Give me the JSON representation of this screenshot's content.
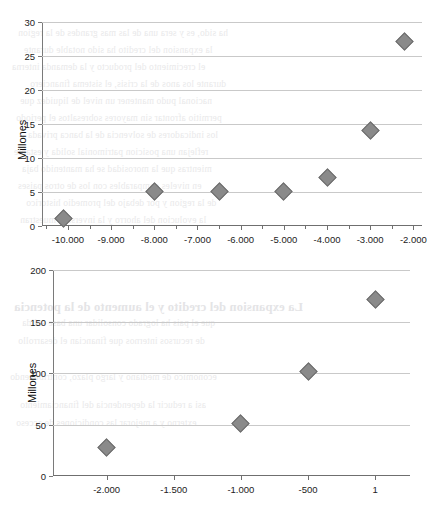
{
  "page": {
    "background_color": "#ffffff",
    "marker_color": "#8a8a8a",
    "marker_border_color": "#6d6d6d",
    "gridline_color": "#c9c9c9",
    "axis_color": "#6f6f6f"
  },
  "bleed_text": [
    "ha sido, es y sera una de las mas grandes de la region",
    "la expansion del credito ha sido notable durante",
    "el crecimiento del producto y la demanda interna",
    "durante los anos de la crisis, el sistema financiero",
    "nacional pudo mantener un nivel de liquidez que",
    "permitio afrontar sin mayores sobresaltos el periodo",
    "los indicadores de solvencia de la banca privada",
    "reflejan una posicion patrimonial solida y estable",
    "mientras que la morosidad se ha mantenido baja",
    "en niveles comparables con los de otros paises",
    "de la region y por debajo del promedio historico",
    "la evolucion del ahorro y la inversion muestran",
    "La expansion del credito y el aumento de la potencia",
    "que el pais ha logrado consolidar una base solida",
    "de recursos internos que financian el desarrollo",
    "economico de mediano y largo plazo, contribuyendo",
    "asi a reducir la dependencia del financiamiento",
    "externo y a mejorar las condiciones de acceso"
  ],
  "chart_data": [
    {
      "id": "chart-top",
      "type": "scatter",
      "title": "",
      "xlabel": "",
      "ylabel": "Millones",
      "ylim": [
        0,
        30
      ],
      "yticks": [
        0,
        5,
        10,
        15,
        20,
        25,
        30
      ],
      "ytick_labels": [
        "0",
        "5",
        "10",
        "15",
        "20",
        "25",
        "30"
      ],
      "xlim": [
        -10600,
        -1800
      ],
      "xticks": [
        -10000,
        -9000,
        -8000,
        -7000,
        -6000,
        -5000,
        -4000,
        -3000,
        -2000
      ],
      "xtick_labels": [
        "-10.000",
        "-9.000",
        "-8.000",
        "-7.000",
        "-6.000",
        "-5.000",
        "-4.000",
        "-3.000",
        "-2.000"
      ],
      "xminor_step": 500,
      "grid": "horizontal",
      "legend": "none",
      "points": [
        {
          "x": -10100,
          "y": 1.1
        },
        {
          "x": -8000,
          "y": 5.1
        },
        {
          "x": -6500,
          "y": 5.1
        },
        {
          "x": -5000,
          "y": 5.1
        },
        {
          "x": -4000,
          "y": 7.2
        },
        {
          "x": -3000,
          "y": 14.1
        },
        {
          "x": -2200,
          "y": 27.1
        }
      ]
    },
    {
      "id": "chart-bottom",
      "type": "scatter",
      "title": "",
      "xlabel": "",
      "ylabel": "Millones",
      "ylim": [
        0,
        200
      ],
      "yticks": [
        0,
        50,
        100,
        150,
        200
      ],
      "ytick_labels": [
        "0",
        "50",
        "100",
        "150",
        "200"
      ],
      "xlim": [
        -2400,
        260
      ],
      "xticks": [
        -2000,
        -1500,
        -1000,
        -500,
        1
      ],
      "xtick_labels": [
        "-2.000",
        "-1.500",
        "-1.000",
        "-500",
        "1"
      ],
      "grid": "horizontal",
      "legend": "none",
      "points": [
        {
          "x": -2000,
          "y": 28
        },
        {
          "x": -1000,
          "y": 51
        },
        {
          "x": -500,
          "y": 101
        },
        {
          "x": 1,
          "y": 171
        }
      ]
    }
  ]
}
